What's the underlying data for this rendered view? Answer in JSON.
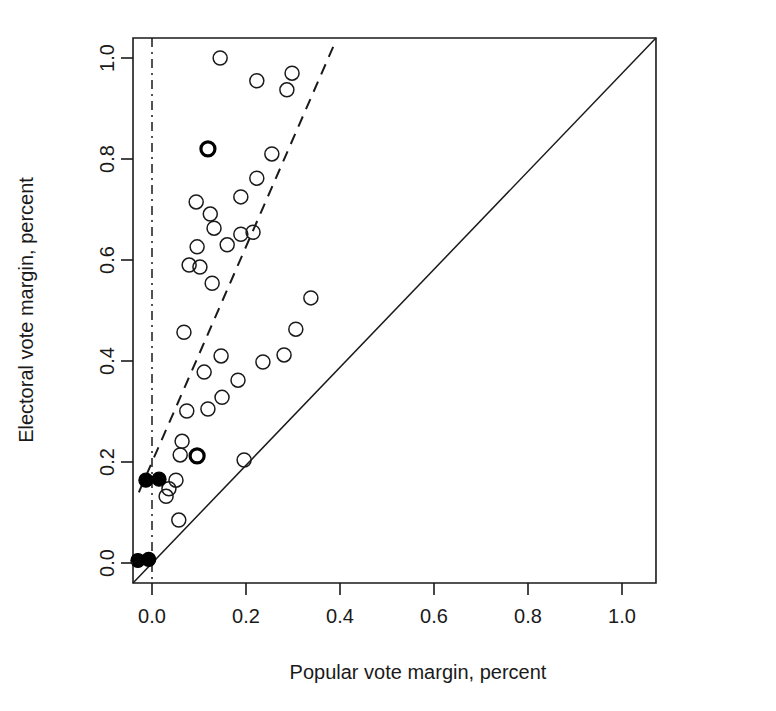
{
  "chart_data": {
    "type": "scatter",
    "title": "",
    "xlabel": "Popular vote margin, percent",
    "ylabel": "Electoral vote margin, percent",
    "xlim": [
      -0.0404,
      1.0723
    ],
    "ylim": [
      -0.0396,
      1.0396
    ],
    "xticks": [
      0.0,
      0.2,
      0.4,
      0.6,
      0.8,
      1.0
    ],
    "yticks": [
      0.0,
      0.2,
      0.4,
      0.6,
      0.8,
      1.0
    ],
    "xticklabels": [
      "0.0",
      "0.2",
      "0.4",
      "0.6",
      "0.8",
      "1.0"
    ],
    "yticklabels": [
      "0.0",
      "0.2",
      "0.4",
      "0.6",
      "0.8",
      "1.0"
    ],
    "grid": false,
    "legend": "none",
    "series": [
      {
        "name": "elections-open",
        "marker": "open-circle",
        "points": [
          [
            0.145,
            1.0
          ],
          [
            0.223,
            0.955
          ],
          [
            0.298,
            0.97
          ],
          [
            0.287,
            0.937
          ],
          [
            0.255,
            0.81
          ],
          [
            0.223,
            0.762
          ],
          [
            0.094,
            0.715
          ],
          [
            0.124,
            0.691
          ],
          [
            0.132,
            0.663
          ],
          [
            0.189,
            0.725
          ],
          [
            0.215,
            0.655
          ],
          [
            0.189,
            0.651
          ],
          [
            0.16,
            0.63
          ],
          [
            0.096,
            0.626
          ],
          [
            0.079,
            0.59
          ],
          [
            0.102,
            0.586
          ],
          [
            0.128,
            0.554
          ],
          [
            0.338,
            0.525
          ],
          [
            0.306,
            0.463
          ],
          [
            0.068,
            0.457
          ],
          [
            0.147,
            0.41
          ],
          [
            0.236,
            0.398
          ],
          [
            0.281,
            0.412
          ],
          [
            0.111,
            0.378
          ],
          [
            0.183,
            0.362
          ],
          [
            0.149,
            0.328
          ],
          [
            0.074,
            0.301
          ],
          [
            0.119,
            0.305
          ],
          [
            0.064,
            0.241
          ],
          [
            0.06,
            0.214
          ],
          [
            0.196,
            0.204
          ],
          [
            0.051,
            0.164
          ],
          [
            0.036,
            0.147
          ],
          [
            0.03,
            0.132
          ],
          [
            0.057,
            0.085
          ]
        ]
      },
      {
        "name": "elections-open-bold",
        "marker": "open-circle-bold",
        "points": [
          [
            0.119,
            0.82
          ],
          [
            0.096,
            0.212
          ]
        ]
      },
      {
        "name": "elections-filled",
        "marker": "filled-circle",
        "points": [
          [
            -0.013,
            0.164
          ],
          [
            0.015,
            0.166
          ],
          [
            -0.03,
            0.005
          ],
          [
            -0.007,
            0.007
          ]
        ]
      }
    ],
    "reference_lines": [
      {
        "name": "identity-line",
        "style": "solid",
        "from": [
          -0.0404,
          -0.0396
        ],
        "to": [
          1.0723,
          1.0396
        ]
      },
      {
        "name": "regression-line",
        "style": "dashed",
        "from": [
          -0.028,
          0.14
        ],
        "to": [
          0.392,
          1.036
        ]
      },
      {
        "name": "zero-vertical-line",
        "style": "dash-dot",
        "x": 0.0
      }
    ]
  },
  "axes": {
    "x_title": "Popular vote margin, percent",
    "y_title": "Electoral vote margin, percent"
  }
}
